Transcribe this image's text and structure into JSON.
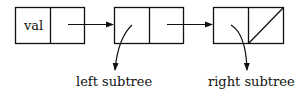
{
  "diagram": {
    "nodes": [
      {
        "id": "cell-1",
        "left_text": "val",
        "right_text": ""
      },
      {
        "id": "cell-2",
        "left_text": "",
        "right_text": ""
      },
      {
        "id": "cell-3",
        "left_text": "",
        "right_text": "null"
      }
    ],
    "labels": {
      "left_subtree": "left subtree",
      "right_subtree": "right subtree"
    },
    "colors": {
      "stroke": "#111111",
      "background": "#ffffff"
    }
  }
}
